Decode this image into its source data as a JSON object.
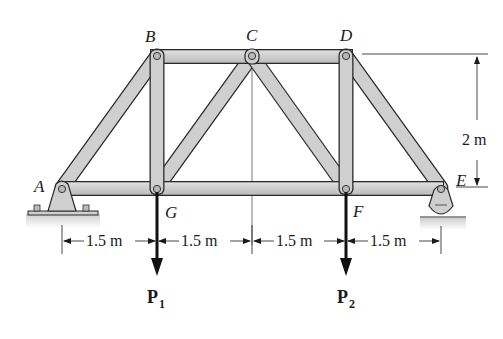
{
  "figure": {
    "type": "planar truss",
    "joints": {
      "A": {
        "label": "A",
        "support": "pin"
      },
      "B": {
        "label": "B"
      },
      "C": {
        "label": "C"
      },
      "D": {
        "label": "D"
      },
      "E": {
        "label": "E",
        "support": "rocker"
      },
      "F": {
        "label": "F"
      },
      "G": {
        "label": "G"
      }
    },
    "members": [
      "AB",
      "BC",
      "CD",
      "DE",
      "AG",
      "GF",
      "FE",
      "BG",
      "GC",
      "CF",
      "DF"
    ],
    "dimensions": {
      "spans": [
        "1.5 m",
        "1.5 m",
        "1.5 m",
        "1.5 m"
      ],
      "height": "2 m"
    },
    "loads": [
      {
        "name": "P",
        "subscript": "1",
        "at": "G",
        "direction": "down"
      },
      {
        "name": "P",
        "subscript": "2",
        "at": "F",
        "direction": "down"
      }
    ],
    "colors": {
      "member_fill": "#cfcfcf",
      "member_edge": "#2a2a2a",
      "line": "#1a1a1a",
      "ground_shadow": "#d8d8d8"
    }
  }
}
